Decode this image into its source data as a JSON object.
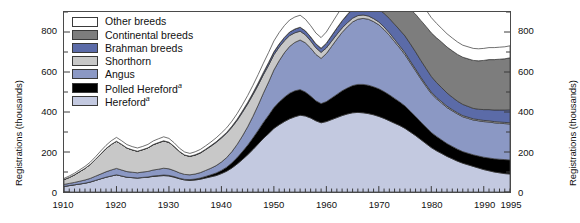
{
  "axes": {
    "y_left_title": "Registrations (thousands)",
    "y_right_title": "Registrations (thousands)",
    "y_ticks": [
      "0",
      "200",
      "400",
      "600",
      "800"
    ],
    "x_ticks": [
      "1910",
      "1920",
      "1930",
      "1940",
      "1950",
      "1960",
      "1970",
      "1980",
      "1990",
      "1995"
    ]
  },
  "legend": {
    "items": [
      {
        "label": "Other breeds",
        "color": "#ffffff",
        "key": "other_breeds"
      },
      {
        "label": "Continental breeds",
        "color": "#7d7d7d",
        "key": "continental_breeds"
      },
      {
        "label": "Brahman breeds",
        "color": "#5b6ba8",
        "key": "brahman_breeds"
      },
      {
        "label": "Shorthorn",
        "color": "#c8c8c8",
        "key": "shorthorn"
      },
      {
        "label": "Angus",
        "color": "#8b98c4",
        "key": "angus"
      },
      {
        "label": "Polled Hereford",
        "color": "#000000",
        "key": "polled_hereford",
        "footnote": "a"
      },
      {
        "label": "Hereford",
        "color": "#c3c9e0",
        "key": "hereford",
        "footnote": "a"
      }
    ]
  },
  "chart_data": {
    "type": "area",
    "stacked": true,
    "title": "",
    "xlabel": "",
    "ylabel": "Registrations (thousands)",
    "xlim": [
      1910,
      1995
    ],
    "ylim": [
      0,
      900
    ],
    "ytick_values": [
      0,
      200,
      400,
      600,
      800
    ],
    "xtick_values": [
      1910,
      1920,
      1930,
      1940,
      1950,
      1960,
      1970,
      1980,
      1990,
      1995
    ],
    "grid": false,
    "legend_position": "top-left-inside",
    "stack_order_bottom_to_top": [
      "Hereford",
      "Polled Hereford",
      "Angus",
      "Shorthorn",
      "Brahman breeds",
      "Continental breeds",
      "Other breeds"
    ],
    "x": [
      1910,
      1911,
      1912,
      1913,
      1914,
      1915,
      1916,
      1917,
      1918,
      1919,
      1920,
      1921,
      1922,
      1923,
      1924,
      1925,
      1926,
      1927,
      1928,
      1929,
      1930,
      1931,
      1932,
      1933,
      1934,
      1935,
      1936,
      1937,
      1938,
      1939,
      1940,
      1941,
      1942,
      1943,
      1944,
      1945,
      1946,
      1947,
      1948,
      1949,
      1950,
      1951,
      1952,
      1953,
      1954,
      1955,
      1956,
      1957,
      1958,
      1959,
      1960,
      1961,
      1962,
      1963,
      1964,
      1965,
      1966,
      1967,
      1968,
      1969,
      1970,
      1971,
      1972,
      1973,
      1974,
      1975,
      1976,
      1977,
      1978,
      1979,
      1980,
      1981,
      1982,
      1983,
      1984,
      1985,
      1986,
      1987,
      1988,
      1989,
      1990,
      1991,
      1992,
      1993,
      1994,
      1995
    ],
    "series": [
      {
        "name": "Hereford",
        "color": "#c3c9e0",
        "values": [
          28,
          32,
          36,
          40,
          44,
          50,
          58,
          66,
          74,
          80,
          86,
          80,
          74,
          72,
          70,
          72,
          74,
          78,
          80,
          82,
          80,
          74,
          66,
          60,
          58,
          60,
          64,
          70,
          76,
          82,
          92,
          104,
          120,
          140,
          162,
          186,
          212,
          240,
          268,
          292,
          318,
          336,
          352,
          366,
          376,
          384,
          380,
          370,
          356,
          346,
          352,
          362,
          372,
          382,
          390,
          396,
          398,
          396,
          392,
          386,
          378,
          368,
          356,
          344,
          332,
          318,
          300,
          282,
          262,
          242,
          222,
          206,
          192,
          178,
          166,
          154,
          144,
          136,
          128,
          120,
          112,
          106,
          100,
          96,
          92,
          90
        ]
      },
      {
        "name": "Polled Hereford",
        "color": "#000000",
        "values": [
          0,
          0,
          0,
          0,
          0,
          0,
          0,
          0,
          0,
          0,
          0,
          0,
          0,
          0,
          0,
          1,
          1,
          2,
          2,
          3,
          3,
          3,
          3,
          3,
          4,
          5,
          6,
          8,
          10,
          13,
          16,
          20,
          26,
          32,
          40,
          48,
          58,
          68,
          80,
          92,
          104,
          114,
          122,
          128,
          130,
          128,
          120,
          110,
          100,
          96,
          100,
          108,
          116,
          124,
          130,
          136,
          140,
          142,
          142,
          140,
          138,
          134,
          130,
          124,
          118,
          112,
          104,
          96,
          88,
          82,
          76,
          72,
          68,
          64,
          62,
          60,
          58,
          58,
          58,
          60,
          62,
          64,
          66,
          68,
          70,
          70
        ]
      },
      {
        "name": "Angus",
        "color": "#8b98c4",
        "values": [
          10,
          11,
          12,
          14,
          16,
          18,
          21,
          24,
          27,
          30,
          32,
          30,
          28,
          27,
          26,
          27,
          28,
          30,
          32,
          34,
          33,
          30,
          27,
          25,
          24,
          25,
          27,
          30,
          33,
          37,
          42,
          48,
          56,
          66,
          78,
          92,
          108,
          126,
          146,
          166,
          188,
          206,
          222,
          234,
          242,
          248,
          246,
          240,
          232,
          226,
          240,
          258,
          276,
          292,
          306,
          318,
          326,
          330,
          330,
          326,
          320,
          310,
          298,
          284,
          270,
          256,
          242,
          228,
          216,
          204,
          194,
          188,
          184,
          180,
          178,
          176,
          174,
          174,
          174,
          176,
          178,
          180,
          180,
          180,
          180,
          180
        ]
      },
      {
        "name": "Shorthorn",
        "color": "#c8c8c8",
        "values": [
          24,
          30,
          38,
          48,
          58,
          70,
          84,
          100,
          116,
          128,
          136,
          128,
          118,
          112,
          108,
          112,
          118,
          126,
          132,
          136,
          132,
          120,
          106,
          96,
          92,
          94,
          98,
          104,
          110,
          116,
          120,
          122,
          122,
          120,
          118,
          114,
          108,
          100,
          92,
          84,
          76,
          68,
          60,
          54,
          48,
          44,
          40,
          36,
          33,
          30,
          28,
          26,
          24,
          22,
          20,
          19,
          18,
          17,
          16,
          15,
          14,
          13,
          12,
          11,
          10,
          10,
          9,
          9,
          8,
          8,
          8,
          7,
          7,
          7,
          6,
          6,
          6,
          6,
          6,
          6,
          6,
          6,
          6,
          6,
          6,
          6
        ]
      },
      {
        "name": "Brahman breeds",
        "color": "#5b6ba8",
        "values": [
          0,
          0,
          0,
          0,
          0,
          0,
          0,
          0,
          0,
          0,
          0,
          0,
          0,
          0,
          0,
          0,
          0,
          1,
          1,
          1,
          1,
          1,
          1,
          1,
          1,
          2,
          2,
          2,
          3,
          3,
          4,
          4,
          5,
          6,
          7,
          8,
          9,
          11,
          12,
          14,
          15,
          16,
          17,
          18,
          19,
          20,
          20,
          20,
          20,
          21,
          24,
          28,
          32,
          36,
          40,
          44,
          48,
          52,
          56,
          60,
          64,
          68,
          72,
          76,
          80,
          84,
          86,
          86,
          84,
          82,
          78,
          74,
          70,
          66,
          62,
          58,
          56,
          54,
          52,
          52,
          54,
          56,
          58,
          60,
          62,
          65
        ]
      },
      {
        "name": "Continental breeds",
        "color": "#7d7d7d",
        "values": [
          0,
          0,
          0,
          0,
          0,
          0,
          0,
          0,
          0,
          0,
          0,
          0,
          0,
          0,
          0,
          0,
          0,
          0,
          0,
          0,
          0,
          0,
          0,
          0,
          0,
          0,
          0,
          0,
          0,
          0,
          0,
          0,
          0,
          0,
          0,
          0,
          0,
          0,
          0,
          0,
          0,
          0,
          0,
          0,
          0,
          0,
          0,
          0,
          0,
          0,
          0,
          0,
          0,
          0,
          2,
          4,
          8,
          14,
          22,
          34,
          48,
          66,
          86,
          108,
          130,
          152,
          172,
          188,
          200,
          210,
          218,
          224,
          228,
          230,
          232,
          234,
          236,
          238,
          240,
          242,
          246,
          250,
          252,
          254,
          256,
          260
        ]
      },
      {
        "name": "Other breeds",
        "color": "#ffffff",
        "values": [
          6,
          7,
          8,
          9,
          10,
          11,
          13,
          15,
          16,
          18,
          19,
          18,
          17,
          16,
          16,
          16,
          17,
          18,
          19,
          20,
          19,
          18,
          16,
          15,
          14,
          15,
          16,
          17,
          18,
          20,
          21,
          23,
          25,
          28,
          31,
          34,
          38,
          42,
          46,
          50,
          54,
          57,
          59,
          60,
          60,
          60,
          58,
          56,
          54,
          53,
          56,
          60,
          64,
          68,
          72,
          76,
          80,
          84,
          88,
          92,
          96,
          100,
          102,
          104,
          104,
          102,
          98,
          94,
          88,
          82,
          76,
          72,
          68,
          66,
          64,
          62,
          60,
          60,
          60,
          60,
          60,
          60,
          60,
          60,
          60,
          60
        ]
      }
    ]
  }
}
